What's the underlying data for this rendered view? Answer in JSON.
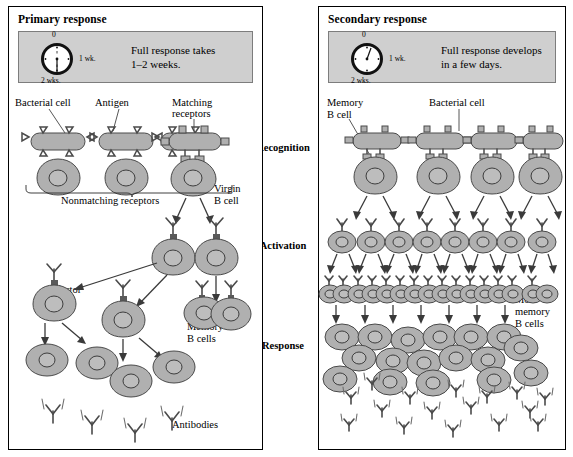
{
  "panels": {
    "primary": {
      "title": "Primary response",
      "info_text_line1": "Full response takes",
      "info_text_line2": "1–2 weeks.",
      "clock": {
        "top": "0",
        "right": "1 wk.",
        "bottom": "2 wks."
      },
      "labels": {
        "bacterial_cell": "Bacterial cell",
        "antigen": "Antigen",
        "matching_receptors_l1": "Matching",
        "matching_receptors_l2": "receptors",
        "nonmatching_receptors": "Nonmatching receptors",
        "virgin_b_cell_l1": "Virgin",
        "virgin_b_cell_l2": "B cell",
        "effector_b_cells_l1": "Effector",
        "effector_b_cells_l2": "B cells",
        "memory_b_cells_l1": "Memory",
        "memory_b_cells_l2": "B cells",
        "antibodies": "Antibodies"
      }
    },
    "secondary": {
      "title": "Secondary response",
      "info_text_line1": "Full response develops",
      "info_text_line2": "in a few days.",
      "clock": {
        "top": "0",
        "right": "1 wk.",
        "bottom": "2 wks."
      },
      "labels": {
        "memory_b_cell_l1": "Memory",
        "memory_b_cell_l2": "B cell",
        "bacterial_cell": "Bacterial cell",
        "more_memory_l1": "More",
        "more_memory_l2": "memory",
        "more_memory_l3": "B cells"
      }
    }
  },
  "stages": {
    "recognition": "Recognition",
    "activation": "Activation",
    "response": "Response"
  },
  "colors": {
    "cell_fill": "#b0b0b0",
    "cell_stroke": "#4a4a4a",
    "info_box_bg": "#cfcfcf",
    "outline": "#000000"
  }
}
